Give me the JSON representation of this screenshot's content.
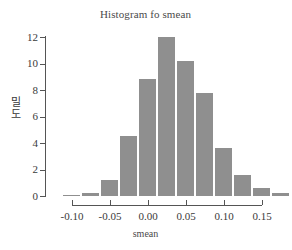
{
  "chart_data": {
    "type": "bar",
    "title": "Histogram fo smean",
    "xlabel": "smean",
    "ylabel": "밀도",
    "ylabel_chars": [
      "밀",
      "도"
    ],
    "grid": false,
    "legend": null,
    "xlim": [
      -0.1125,
      0.15
    ],
    "ylim": [
      0,
      12
    ],
    "bar_width": 0.025,
    "xticks": [
      -0.1,
      -0.05,
      0.0,
      0.05,
      0.1,
      0.15
    ],
    "xtick_labels": [
      "-0.10",
      "-0.05",
      "0.00",
      "0.05",
      "0.10",
      "0.15"
    ],
    "yticks": [
      0,
      2,
      4,
      6,
      8,
      10,
      12
    ],
    "ytick_labels": [
      "0",
      "2",
      "4",
      "6",
      "8",
      "10",
      "12"
    ],
    "bar_color": "#8f8f8f",
    "axis_color": "#555555",
    "background": "#ffffff",
    "bins": [
      {
        "left": -0.1125,
        "right": -0.0875,
        "center": -0.1,
        "value": 0.1
      },
      {
        "left": -0.0875,
        "right": -0.0625,
        "center": -0.075,
        "value": 0.25
      },
      {
        "left": -0.0625,
        "right": -0.0375,
        "center": -0.05,
        "value": 1.2
      },
      {
        "left": -0.0375,
        "right": -0.0125,
        "center": -0.025,
        "value": 4.5
      },
      {
        "left": -0.0125,
        "right": 0.0125,
        "center": 0.0,
        "value": 8.8
      },
      {
        "left": 0.0125,
        "right": 0.0375,
        "center": 0.025,
        "value": 12.0
      },
      {
        "left": 0.0375,
        "right": 0.0625,
        "center": 0.05,
        "value": 10.2
      },
      {
        "left": 0.0625,
        "right": 0.0875,
        "center": 0.075,
        "value": 7.8
      },
      {
        "left": 0.0875,
        "right": 0.1125,
        "center": 0.1,
        "value": 3.6
      },
      {
        "left": 0.1125,
        "right": 0.1375,
        "center": 0.125,
        "value": 1.55
      },
      {
        "left": 0.1375,
        "right": 0.1625,
        "center": 0.15,
        "value": 0.6
      },
      {
        "left": 0.1625,
        "right": 0.1875,
        "center": 0.175,
        "value": 0.22
      },
      {
        "left": 0.1875,
        "right": 0.2125,
        "center": 0.2,
        "value": 0.1
      },
      {
        "left": 0.2125,
        "right": 0.2375,
        "center": 0.225,
        "value": 0.1
      }
    ],
    "values": [
      0.1,
      0.25,
      1.2,
      4.5,
      8.8,
      12.0,
      10.2,
      7.8,
      3.6,
      1.55,
      0.6,
      0.22,
      0.1,
      0.1
    ]
  }
}
